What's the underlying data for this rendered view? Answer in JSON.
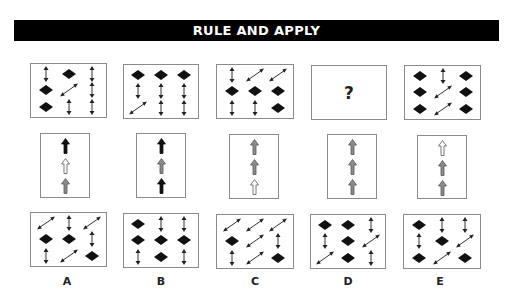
{
  "title": "RULE AND APPLY",
  "legend": {
    "D": "diamond (black filled rhombus)",
    "V": "vertical double-headed arrow",
    "G": "diagonal double-headed arrow"
  },
  "question_row": [
    {
      "id": "1",
      "cells": [
        [
          "V",
          "D",
          "V"
        ],
        [
          "D",
          "G",
          "V"
        ],
        [
          "D",
          "V",
          "V"
        ]
      ]
    },
    {
      "id": "2",
      "cells": [
        [
          "D",
          "D",
          "D"
        ],
        [
          "V",
          "V",
          "V"
        ],
        [
          "G",
          "V",
          "V"
        ]
      ]
    },
    {
      "id": "3",
      "cells": [
        [
          "V",
          "G",
          "G"
        ],
        [
          "D",
          "D",
          "D"
        ],
        [
          "V",
          "V",
          "D"
        ]
      ]
    },
    {
      "id": "4",
      "unknown": true,
      "symbol": "?"
    },
    {
      "id": "5",
      "cells": [
        [
          "D",
          "V",
          "D"
        ],
        [
          "D",
          "G",
          "D"
        ],
        [
          "D",
          "G",
          "D"
        ]
      ]
    }
  ],
  "rule_row": [
    {
      "id": "1",
      "arrows": [
        "black",
        "white",
        "gray"
      ]
    },
    {
      "id": "2",
      "arrows": [
        "black",
        "gray",
        "black"
      ]
    },
    {
      "id": "3",
      "arrows": [
        "gray",
        "gray",
        "white"
      ]
    },
    {
      "id": "4",
      "arrows": [
        "gray",
        "gray",
        "gray"
      ]
    },
    {
      "id": "5",
      "arrows": [
        "white",
        "gray",
        "gray"
      ]
    }
  ],
  "options": [
    {
      "label": "A",
      "cells": [
        [
          "G",
          "V",
          "G"
        ],
        [
          "D",
          "D",
          "V"
        ],
        [
          "V",
          "G",
          "D"
        ]
      ]
    },
    {
      "label": "B",
      "cells": [
        [
          "D",
          "V",
          "V"
        ],
        [
          "D",
          "D",
          "D"
        ],
        [
          "V",
          "D",
          "V"
        ]
      ]
    },
    {
      "label": "C",
      "cells": [
        [
          "G",
          "G",
          "G"
        ],
        [
          "D",
          "G",
          "V"
        ],
        [
          "V",
          "G",
          "D"
        ]
      ]
    },
    {
      "label": "D",
      "cells": [
        [
          "D",
          "D",
          "V"
        ],
        [
          "V",
          "D",
          "G"
        ],
        [
          "G",
          "D",
          "V"
        ]
      ]
    },
    {
      "label": "E",
      "cells": [
        [
          "D",
          "V",
          "V"
        ],
        [
          "V",
          "D",
          "G"
        ],
        [
          "D",
          "G",
          "D"
        ]
      ]
    }
  ],
  "colors": {
    "black": "#111111",
    "gray": "#8c8c8c",
    "white": "#ffffff",
    "banner_bg": "#000000",
    "banner_text": "#ffffff"
  }
}
